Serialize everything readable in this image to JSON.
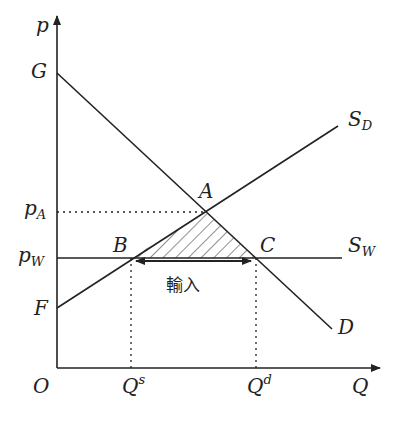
{
  "diagram": {
    "type": "supply-demand-import",
    "axes": {
      "y_label": "p",
      "x_label": "Q",
      "origin_label": "O"
    },
    "price_labels": {
      "G": "G",
      "pA_main": "p",
      "pA_sub": "A",
      "pW_main": "p",
      "pW_sub": "W",
      "F": "F"
    },
    "quantity_labels": {
      "Qs_main": "Q",
      "Qs_sup": "s",
      "Qd_main": "Q",
      "Qd_sup": "d"
    },
    "points": {
      "A": "A",
      "B": "B",
      "C": "C"
    },
    "curves": {
      "SD_main": "S",
      "SD_sub": "D",
      "SW_main": "S",
      "SW_sub": "W",
      "D": "D"
    },
    "import_label": "輸入",
    "colors": {
      "line": "#222222",
      "background": "#ffffff"
    }
  }
}
